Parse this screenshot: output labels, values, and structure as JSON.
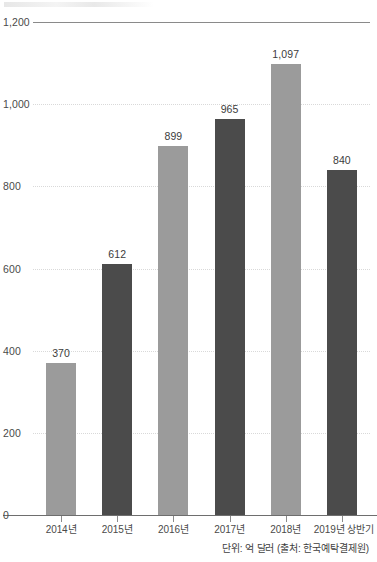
{
  "chart_data": {
    "type": "bar",
    "title": "",
    "xlabel": "",
    "ylabel": "",
    "ylim": [
      0,
      1200
    ],
    "grid": true,
    "legend": "none",
    "categories": [
      "2014년",
      "2015년",
      "2016년",
      "2017년",
      "2018년",
      "2019년 상반기"
    ],
    "values": [
      370,
      612,
      899,
      965,
      1097,
      840
    ],
    "value_labels": [
      "370",
      "612",
      "899",
      "965",
      "1,097",
      "840"
    ],
    "ytick_values": [
      0,
      200,
      400,
      600,
      800,
      1000,
      1200
    ],
    "ytick_labels": [
      "0",
      "200",
      "400",
      "600",
      "800",
      "1,000",
      "1,200"
    ],
    "bar_colors": [
      "#9b9b9b",
      "#4b4b4b",
      "#9b9b9b",
      "#4b4b4b",
      "#9b9b9b",
      "#4b4b4b"
    ],
    "annotations": {
      "source_note": "단위: 억 달러 (출처: 한국예탁결제원)"
    }
  },
  "colors": {
    "bar_light": "#9b9b9b",
    "bar_dark": "#4b4b4b",
    "gridline": "#d9d9d9",
    "axis": "#6e6e6e",
    "text": "#3f3f3f",
    "background": "#ffffff"
  }
}
